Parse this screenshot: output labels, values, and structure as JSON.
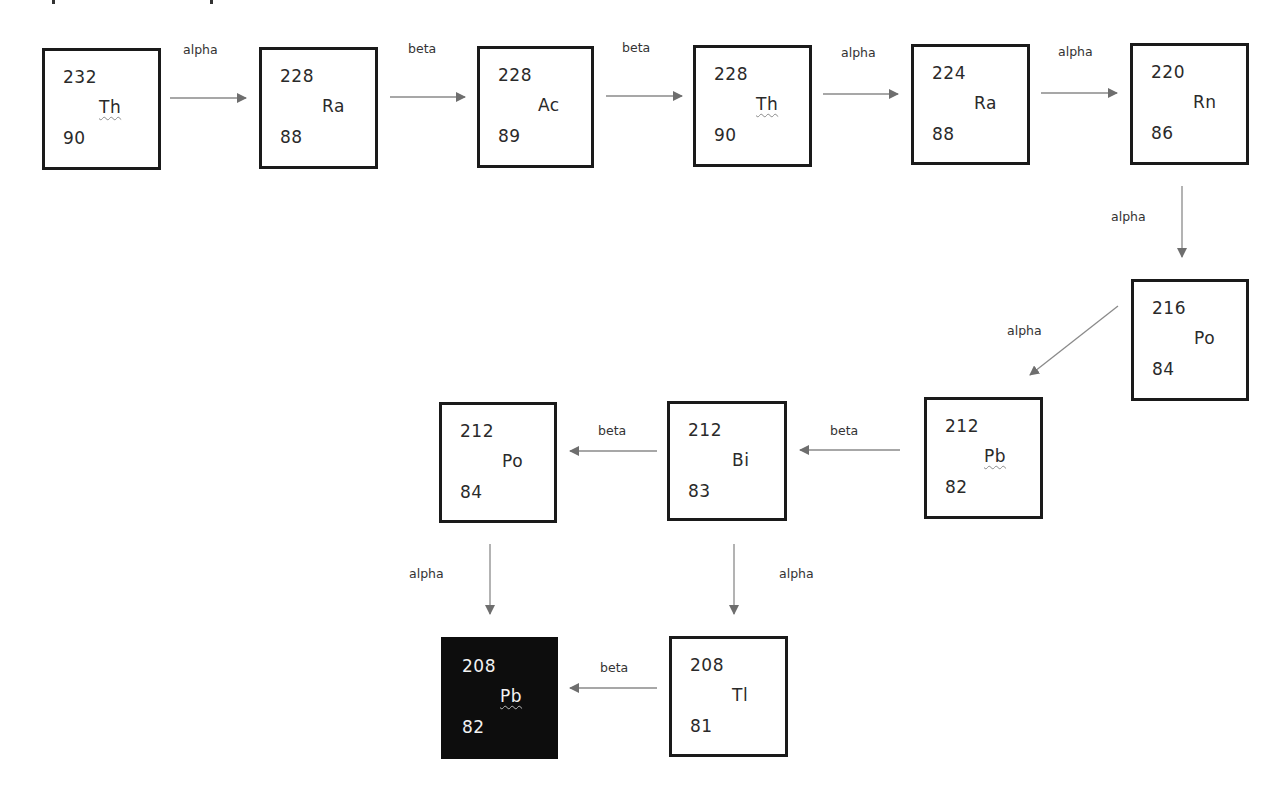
{
  "diagram": {
    "type": "decay-chain",
    "colors": {
      "box_border": "#1a1a1a",
      "arrow": "#777777",
      "final_fill": "#0d0d0d",
      "final_text": "#f2f2f2"
    },
    "nuclides": [
      {
        "id": "th232",
        "mass": "232",
        "symbol": "Th",
        "z": "90"
      },
      {
        "id": "ra228",
        "mass": "228",
        "symbol": "Ra",
        "z": "88"
      },
      {
        "id": "ac228",
        "mass": "228",
        "symbol": "Ac",
        "z": "89"
      },
      {
        "id": "th228",
        "mass": "228",
        "symbol": "Th",
        "z": "90"
      },
      {
        "id": "ra224",
        "mass": "224",
        "symbol": "Ra",
        "z": "88"
      },
      {
        "id": "rn220",
        "mass": "220",
        "symbol": "Rn",
        "z": "86"
      },
      {
        "id": "po216",
        "mass": "216",
        "symbol": "Po",
        "z": "84"
      },
      {
        "id": "pb212",
        "mass": "212",
        "symbol": "Pb",
        "z": "82"
      },
      {
        "id": "bi212",
        "mass": "212",
        "symbol": "Bi",
        "z": "83"
      },
      {
        "id": "po212",
        "mass": "212",
        "symbol": "Po",
        "z": "84"
      },
      {
        "id": "tl208",
        "mass": "208",
        "symbol": "Tl",
        "z": "81"
      },
      {
        "id": "pb208",
        "mass": "208",
        "symbol": "Pb",
        "z": "82",
        "final": true
      }
    ],
    "transitions": [
      {
        "from": "th232",
        "to": "ra228",
        "label": "alpha"
      },
      {
        "from": "ra228",
        "to": "ac228",
        "label": "beta"
      },
      {
        "from": "ac228",
        "to": "th228",
        "label": "beta"
      },
      {
        "from": "th228",
        "to": "ra224",
        "label": "alpha"
      },
      {
        "from": "ra224",
        "to": "rn220",
        "label": "alpha"
      },
      {
        "from": "rn220",
        "to": "po216",
        "label": "alpha"
      },
      {
        "from": "po216",
        "to": "pb212",
        "label": "alpha"
      },
      {
        "from": "pb212",
        "to": "bi212",
        "label": "beta"
      },
      {
        "from": "bi212",
        "to": "po212",
        "label": "beta"
      },
      {
        "from": "bi212",
        "to": "tl208",
        "label": "alpha"
      },
      {
        "from": "po212",
        "to": "pb208",
        "label": "alpha"
      },
      {
        "from": "tl208",
        "to": "pb208",
        "label": "beta"
      }
    ]
  }
}
